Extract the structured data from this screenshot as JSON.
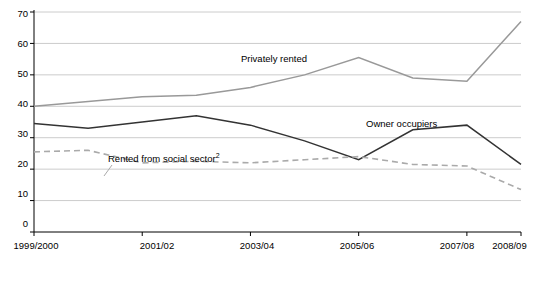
{
  "chart_data": {
    "type": "line",
    "title": "",
    "subtitle": "",
    "xlabel": "",
    "ylabel": "",
    "ylim": [
      0,
      70
    ],
    "yticks": [
      0,
      10,
      20,
      30,
      40,
      50,
      60,
      70
    ],
    "grid": true,
    "legend_position": "inline-annotations",
    "categories": [
      "1999/2000",
      "2000/01",
      "2001/02",
      "2002/03",
      "2003/04",
      "2004/05",
      "2005/06",
      "2006/07",
      "2007/08",
      "2008/09"
    ],
    "xtick_labels": [
      "1999/2000",
      "2001/02",
      "2003/04",
      "2005/06",
      "2007/08",
      "2008/09"
    ],
    "xtick_indices": [
      0,
      2,
      4,
      6,
      8,
      9
    ],
    "series": [
      {
        "name": "Privately rented",
        "color": "#999999",
        "style": "solid",
        "values": [
          40,
          41.5,
          43,
          43.5,
          46,
          50,
          55.5,
          49,
          48,
          67
        ]
      },
      {
        "name": "Owner occupiers",
        "color": "#333333",
        "style": "solid",
        "values": [
          34.5,
          33,
          35,
          37,
          34,
          29,
          23,
          32.5,
          34,
          21.5
        ]
      },
      {
        "name": "Rented from social sector",
        "name_suffix": "2",
        "color": "#aaaaaa",
        "style": "dashed",
        "values": [
          25.5,
          26,
          22,
          22.5,
          22,
          23,
          24,
          21.5,
          21,
          13.5
        ]
      }
    ],
    "annotations": [
      {
        "text": "Privately rented",
        "series": "Privately rented"
      },
      {
        "text": "Owner occupiers",
        "series": "Owner occupiers"
      },
      {
        "text": "Rented from social sector",
        "superscript": "2",
        "series": "Rented from social sector"
      }
    ]
  }
}
